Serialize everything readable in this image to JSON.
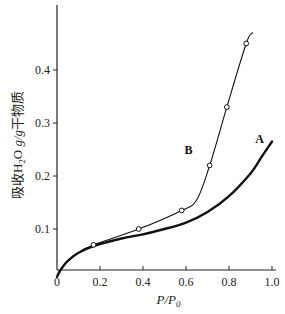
{
  "chart_data": {
    "type": "line",
    "title": "",
    "xlabel": "P/P0",
    "ylabel": "吸收H2O g/g干物质",
    "xlim": [
      0,
      1.0
    ],
    "ylim": [
      0,
      0.5
    ],
    "xticks": [
      "0",
      "0.2",
      "0.4",
      "0.6",
      "0.8",
      "1.0"
    ],
    "yticks": [
      "0.1",
      "0.2",
      "0.3",
      "0.4"
    ],
    "grid": false,
    "legend": "inline labels",
    "series": [
      {
        "name": "A",
        "style": "thick solid line, no markers",
        "x": [
          0.0,
          0.02,
          0.05,
          0.1,
          0.17,
          0.3,
          0.4,
          0.5,
          0.6,
          0.7,
          0.8,
          0.9,
          0.95,
          1.0
        ],
        "y": [
          0.01,
          0.025,
          0.04,
          0.055,
          0.068,
          0.082,
          0.09,
          0.1,
          0.112,
          0.132,
          0.162,
          0.205,
          0.235,
          0.265
        ]
      },
      {
        "name": "B",
        "style": "thin solid line with open circle markers",
        "x": [
          0.0,
          0.02,
          0.05,
          0.1,
          0.17,
          0.38,
          0.58,
          0.65,
          0.71,
          0.79,
          0.88,
          0.91
        ],
        "y": [
          0.01,
          0.025,
          0.04,
          0.055,
          0.07,
          0.1,
          0.135,
          0.155,
          0.22,
          0.33,
          0.45,
          0.47
        ],
        "markers": [
          [
            0.17,
            0.07
          ],
          [
            0.38,
            0.1
          ],
          [
            0.58,
            0.135
          ],
          [
            0.71,
            0.22
          ],
          [
            0.79,
            0.33
          ],
          [
            0.88,
            0.45
          ]
        ]
      }
    ],
    "annotations": [
      {
        "text": "A",
        "x": 0.97,
        "y": 0.27
      },
      {
        "text": "B",
        "x": 0.64,
        "y": 0.25
      }
    ]
  },
  "labels": {
    "origin": "0",
    "series_a": "A",
    "series_b": "B"
  }
}
